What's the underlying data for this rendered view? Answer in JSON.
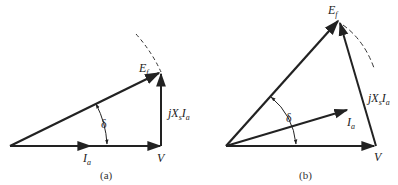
{
  "figure": {
    "panels": [
      {
        "id": "a",
        "caption": "(a)",
        "labels": {
          "ef_main": "E",
          "ef_sub": "f",
          "jx_j": "j",
          "jx_x": "X",
          "jx_xsub": "s",
          "jx_i": "I",
          "jx_isub": "a",
          "delta": "δ",
          "ia_main": "I",
          "ia_sub": "a",
          "v": "V"
        }
      },
      {
        "id": "b",
        "caption": "(b)",
        "labels": {
          "ef_main": "E",
          "ef_sub": "f",
          "jx_j": "j",
          "jx_x": "X",
          "jx_xsub": "s",
          "jx_i": "I",
          "jx_isub": "a",
          "delta": "δ",
          "ia_main": "I",
          "ia_sub": "a",
          "v": "V"
        }
      }
    ],
    "colors": {
      "stroke": "#222222",
      "background": "#ffffff"
    }
  }
}
